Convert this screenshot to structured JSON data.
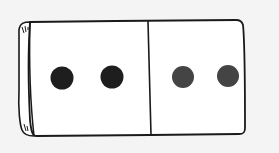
{
  "illustration": {
    "subject": "domino tile",
    "halves": [
      {
        "side": "left",
        "pips": 2,
        "pip_color": "#1e1e1e"
      },
      {
        "side": "right",
        "pips": 2,
        "pip_color": "#444444"
      }
    ],
    "colors": {
      "background": "#f4f4f4",
      "tile_fill": "#ffffff",
      "outline": "#1a1a1a"
    }
  }
}
